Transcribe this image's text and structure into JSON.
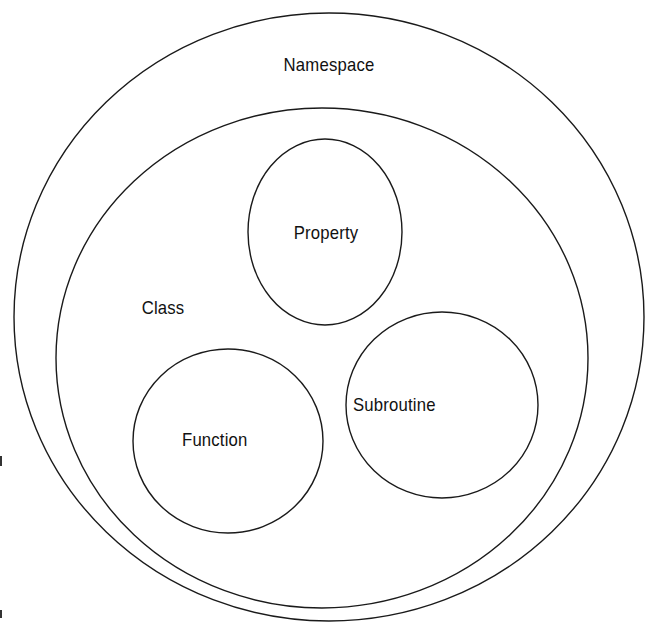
{
  "diagram": {
    "type": "nested-containment",
    "namespace": {
      "label": "Namespace"
    },
    "class": {
      "label": "Class"
    },
    "members": [
      {
        "label": "Property"
      },
      {
        "label": "Function"
      },
      {
        "label": "Subroutine"
      }
    ]
  },
  "colors": {
    "background": "#ffffff",
    "stroke": "#1a1a1a",
    "text": "#111111"
  }
}
